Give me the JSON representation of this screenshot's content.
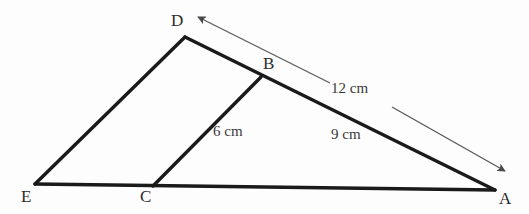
{
  "figure": {
    "kind": "geometry-diagram",
    "background_color": "#fdfdfd",
    "stroke_color": "#1a1a1a",
    "arrow_color": "#555555",
    "label_color": "#2b2b2b"
  },
  "vertices": [
    {
      "id": "D",
      "label": "D",
      "x": 185,
      "y": 37
    },
    {
      "id": "B",
      "label": "B",
      "x": 261,
      "y": 77
    },
    {
      "id": "E",
      "label": "E",
      "x": 35,
      "y": 184
    },
    {
      "id": "C",
      "label": "C",
      "x": 153,
      "y": 186
    },
    {
      "id": "A",
      "label": "A",
      "x": 495,
      "y": 190
    }
  ],
  "segments": [
    {
      "id": "ED",
      "from": "E",
      "to": "D",
      "style": "thick-solid"
    },
    {
      "id": "DA",
      "from": "D",
      "to": "A",
      "style": "thick-solid"
    },
    {
      "id": "EA",
      "from": "E",
      "to": "A",
      "style": "thick-solid"
    },
    {
      "id": "BC",
      "from": "B",
      "to": "C",
      "style": "thick-solid"
    }
  ],
  "annotations": {
    "arrow": {
      "name": "double-headed-arrow-DA",
      "heads": "both",
      "start": {
        "x": 198,
        "y": 17
      },
      "end": {
        "x": 505,
        "y": 171
      },
      "gap_for_label": true
    },
    "lengths": [
      {
        "id": "len-12",
        "text": "12 cm",
        "measures": "DA",
        "x": 331,
        "y": 81
      },
      {
        "id": "len-9",
        "text": "9 cm",
        "measures": "BA",
        "x": 331,
        "y": 127
      },
      {
        "id": "len-6",
        "text": "6 cm",
        "measures": "BC",
        "x": 213,
        "y": 124
      }
    ]
  }
}
